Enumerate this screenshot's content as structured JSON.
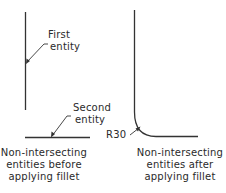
{
  "diagram": {
    "type": "cad-fillet-illustration",
    "colors": {
      "line": "#333333",
      "text": "#2a2a2a",
      "background": "#ffffff"
    },
    "left": {
      "first_entity_label": [
        "First",
        "entity"
      ],
      "second_entity_label": [
        "Second",
        "entity"
      ],
      "caption": [
        "Non-intersecting",
        "entities before",
        "applying fillet"
      ]
    },
    "right": {
      "radius_label": "R30",
      "caption": [
        "Non-intersecting",
        "entities after",
        "applying fillet"
      ]
    }
  }
}
